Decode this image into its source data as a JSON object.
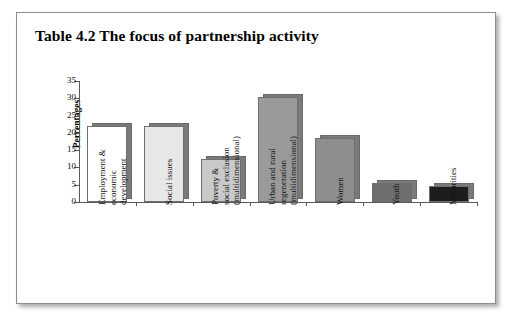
{
  "figure": {
    "title": "Table 4.2 The focus of partnership activity"
  },
  "chart_data": {
    "type": "bar",
    "title": "Table 4.2 The focus of partnership activity",
    "xlabel": "",
    "ylabel": "Percentages",
    "ylim": [
      0,
      35
    ],
    "yticks": [
      0,
      5,
      10,
      15,
      20,
      25,
      30,
      35
    ],
    "ytick_labels": [
      "0",
      "5",
      "10",
      "15",
      "20",
      "25",
      "30",
      "35"
    ],
    "grid": false,
    "legend": "none",
    "categories": [
      "Employment & economic development",
      "Social issues",
      "Poverty & social exclusion (multidimensional)",
      "Urban and rural regeneration (multidimensional)",
      "Women",
      "Youth",
      "Minorities"
    ],
    "category_lines": [
      [
        "Employment &",
        "economic",
        "development"
      ],
      [
        "Social issues"
      ],
      [
        "Poverty &",
        "social exclusion",
        "(multidimensional)"
      ],
      [
        "Urban and rural",
        "regeneration",
        "(multidimensional)"
      ],
      [
        "Women"
      ],
      [
        "Youth"
      ],
      [
        "Minorities"
      ]
    ],
    "values": [
      22,
      22,
      12.5,
      30.5,
      18.5,
      5.5,
      4.5
    ],
    "bar_colors": [
      "#ffffff",
      "#e8e8e8",
      "#c9c9c9",
      "#9a9a9a",
      "#8e8e8e",
      "#6e6e6e",
      "#1d1d1d"
    ],
    "shadow_color": "#7a7a7a"
  }
}
